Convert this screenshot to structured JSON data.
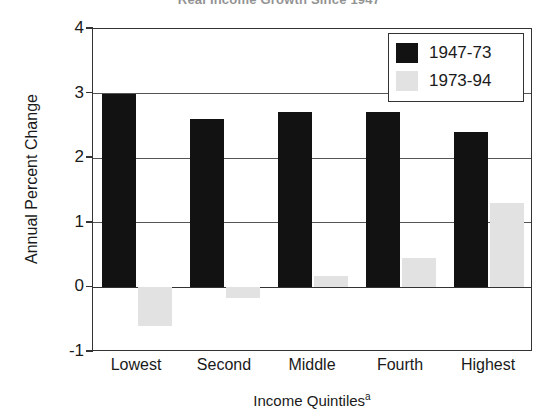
{
  "chart_data": {
    "type": "bar",
    "title": "Real Income Growth Since 1947",
    "xlabel": "Income Quintiles",
    "xlabel_superscript": "a",
    "ylabel": "Annual Percent Change",
    "categories": [
      "Lowest",
      "Second",
      "Middle",
      "Fourth",
      "Highest"
    ],
    "series": [
      {
        "name": "1947-73",
        "color": "#121212",
        "values": [
          3.0,
          2.6,
          2.72,
          2.72,
          2.4
        ]
      },
      {
        "name": "1973-94",
        "color": "#e2e2e2",
        "values": [
          -0.6,
          -0.17,
          0.18,
          0.45,
          1.3
        ]
      }
    ],
    "ylim": [
      -1,
      4
    ],
    "yticks": [
      4,
      3,
      2,
      1,
      0,
      -1
    ],
    "ytick_labels": [
      "4",
      "3",
      "2",
      "1",
      "0",
      "-1"
    ],
    "grid": true,
    "legend_position": "top-right"
  }
}
